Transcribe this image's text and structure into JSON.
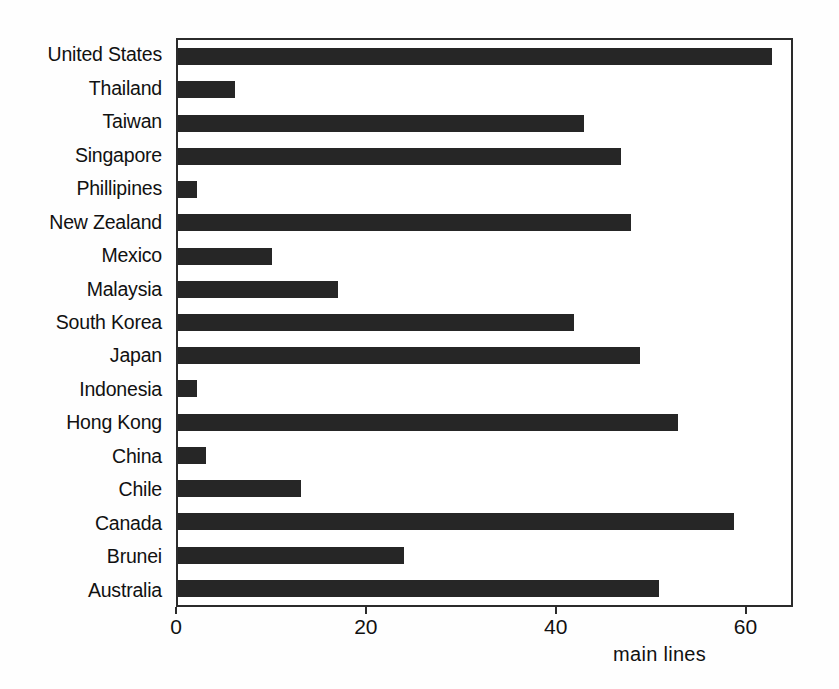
{
  "chart_data": {
    "type": "bar",
    "orientation": "horizontal",
    "title": "",
    "subtitle": "",
    "xlabel": "main lines",
    "ylabel": "",
    "categories": [
      "United States",
      "Thailand",
      "Taiwan",
      "Singapore",
      "Phillipines",
      "New Zealand",
      "Mexico",
      "Malaysia",
      "South Korea",
      "Japan",
      "Indonesia",
      "Hong Kong",
      "China",
      "Chile",
      "Canada",
      "Brunei",
      "Australia"
    ],
    "values": [
      63,
      6,
      43,
      47,
      2,
      48,
      10,
      17,
      42,
      49,
      2,
      53,
      3,
      13,
      59,
      24,
      51
    ],
    "xlim": [
      0,
      65
    ],
    "xticks": [
      0,
      20,
      40,
      60
    ],
    "xtick_labels": [
      "0",
      "20",
      "40",
      "60"
    ],
    "grid": false,
    "legend": null,
    "bar_color": "#262626",
    "axis_color": "#2b2b2b",
    "background_color": "#ffffff"
  },
  "axis": {
    "x_title": "main lines",
    "ticks": [
      {
        "label": "0",
        "value": 0
      },
      {
        "label": "20",
        "value": 20
      },
      {
        "label": "40",
        "value": 40
      },
      {
        "label": "60",
        "value": 60
      }
    ]
  },
  "series": [
    {
      "label": "United States",
      "value": 63
    },
    {
      "label": "Thailand",
      "value": 6
    },
    {
      "label": "Taiwan",
      "value": 43
    },
    {
      "label": "Singapore",
      "value": 47
    },
    {
      "label": "Phillipines",
      "value": 2
    },
    {
      "label": "New Zealand",
      "value": 48
    },
    {
      "label": "Mexico",
      "value": 10
    },
    {
      "label": "Malaysia",
      "value": 17
    },
    {
      "label": "South Korea",
      "value": 42
    },
    {
      "label": "Japan",
      "value": 49
    },
    {
      "label": "Indonesia",
      "value": 2
    },
    {
      "label": "Hong Kong",
      "value": 53
    },
    {
      "label": "China",
      "value": 3
    },
    {
      "label": "Chile",
      "value": 13
    },
    {
      "label": "Canada",
      "value": 59
    },
    {
      "label": "Brunei",
      "value": 24
    },
    {
      "label": "Australia",
      "value": 51
    }
  ]
}
